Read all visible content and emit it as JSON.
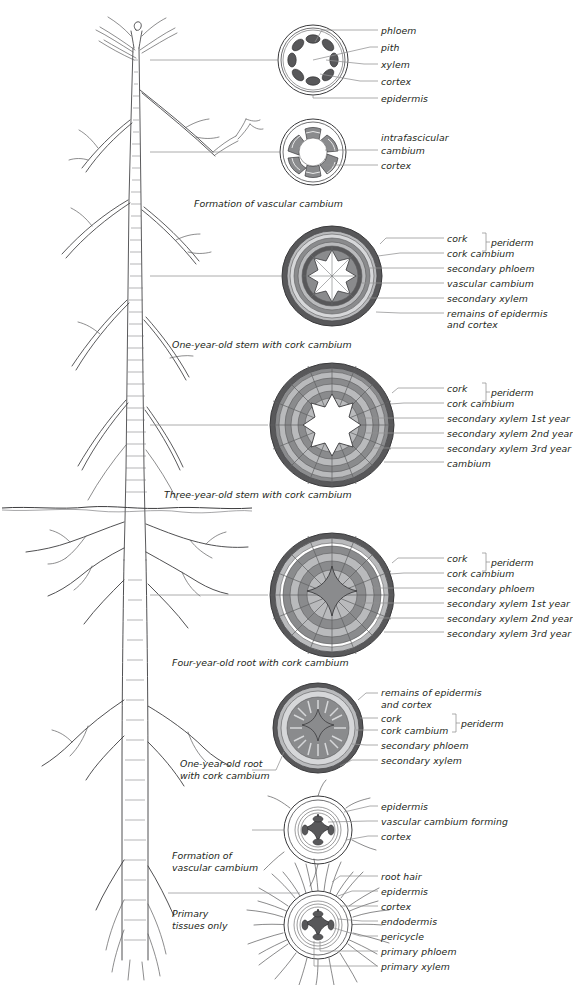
{
  "figure": {
    "colors": {
      "ink": "#231f20",
      "leader": "#8b8b8b",
      "dark_ring": "#58585a",
      "mid_ring": "#898a8c",
      "light_ring": "#b8b9bb",
      "pale_ring": "#d5d6d8",
      "white": "#ffffff",
      "soil_line": "#4a4a4a"
    }
  },
  "panels": [
    {
      "id": "young-stem",
      "caption": "",
      "labels": [
        "phloem",
        "pith",
        "xylem",
        "cortex",
        "epidermis"
      ]
    },
    {
      "id": "stem-vascular-cambium",
      "caption": "Formation of vascular cambium",
      "labels": [
        "intrafascicular",
        "cambium",
        "cortex"
      ]
    },
    {
      "id": "one-year-stem",
      "caption": "One-year-old stem with cork cambium",
      "labels": [
        "cork",
        "cork cambium",
        "secondary phloem",
        "vascular cambium",
        "secondary xylem",
        "remains of epidermis",
        "and cortex"
      ],
      "bracket": "periderm"
    },
    {
      "id": "three-year-stem",
      "caption": "Three-year-old stem with cork cambium",
      "labels": [
        "cork",
        "cork cambium",
        "secondary xylem 1st year",
        "secondary xylem 2nd year",
        "secondary xylem 3rd year",
        "cambium"
      ],
      "bracket": "periderm"
    },
    {
      "id": "four-year-root",
      "caption": "Four-year-old root with cork cambium",
      "labels": [
        "cork",
        "cork cambium",
        "secondary phloem",
        "secondary xylem 1st year",
        "secondary xylem 2nd year",
        "secondary xylem 3rd year"
      ],
      "bracket": "periderm"
    },
    {
      "id": "one-year-root",
      "caption_lines": [
        "One-year-old root",
        "with cork cambium"
      ],
      "labels": [
        "remains of epidermis",
        "and cortex",
        "cork",
        "cork cambium",
        "secondary phloem",
        "secondary xylem"
      ],
      "bracket": "periderm"
    },
    {
      "id": "root-vascular-cambium",
      "caption_lines": [
        "Formation of",
        "vascular cambium"
      ],
      "labels": [
        "epidermis",
        "vascular cambium forming",
        "cortex"
      ]
    },
    {
      "id": "primary-root",
      "caption_lines": [
        "Primary",
        "tissues only"
      ],
      "labels": [
        "root hair",
        "epidermis",
        "cortex",
        "endodermis",
        "pericycle",
        "primary phloem",
        "primary xylem"
      ]
    }
  ],
  "tree": {
    "description": "line drawing of a young tree with bare branches above ground and a branching root system below",
    "soil_line_label": ""
  }
}
